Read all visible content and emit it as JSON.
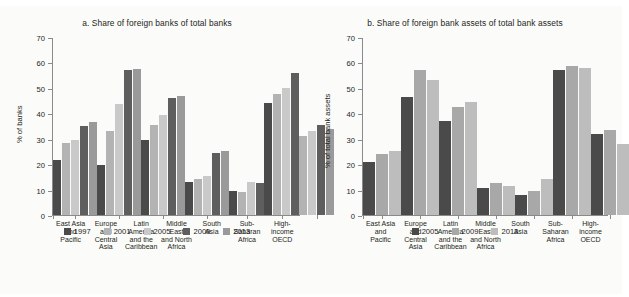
{
  "figure": {
    "background": "#fbfbf9",
    "regions": [
      [
        "East Asia",
        "and",
        "Pacific"
      ],
      [
        "Europe",
        "and",
        "Central",
        "Asia"
      ],
      [
        "Latin",
        "America",
        "and the",
        "Caribbean"
      ],
      [
        "Middle",
        "East",
        "and North",
        "Africa"
      ],
      [
        "South",
        "Asia"
      ],
      [
        "Sub-",
        "Saharan",
        "Africa"
      ],
      [
        "High-",
        "income",
        "OECD"
      ]
    ]
  },
  "chart_data": [
    {
      "type": "bar",
      "panel": "a",
      "title": "a. Share of foreign banks of total banks",
      "xlabel": "",
      "ylabel": "% of banks",
      "ylim": [
        0,
        70
      ],
      "yticks": [
        0,
        10,
        20,
        30,
        40,
        50,
        60,
        70
      ],
      "ytick_labels": [
        "0",
        "10",
        "20",
        "30",
        "40",
        "50",
        "60",
        "70"
      ],
      "grid": false,
      "legend_position": "bottom",
      "categories": [
        "East Asia and Pacific",
        "Europe and Central Asia",
        "Latin America and the Caribbean",
        "Middle East and North Africa",
        "South Asia",
        "Sub-Saharan Africa",
        "High-income OECD"
      ],
      "series": [
        {
          "name": "1997",
          "color": "#4a4a4a",
          "values": [
            21.5,
            19.5,
            29.5,
            13.0,
            9.5,
            44.0,
            null
          ]
        },
        {
          "name": "2001",
          "color": "#b3b3b3",
          "values": [
            28.5,
            33.0,
            35.5,
            14.0,
            9.0,
            47.5,
            31.0
          ]
        },
        {
          "name": "2005",
          "color": "#c9c9c9",
          "values": [
            29.5,
            43.5,
            39.5,
            15.5,
            13.0,
            50.0,
            33.0
          ]
        },
        {
          "name": "2009",
          "color": "#5e5e5e",
          "values": [
            35.0,
            57.0,
            46.0,
            24.5,
            12.5,
            56.0,
            35.5
          ]
        },
        {
          "name": "2013",
          "color": "#9a9a9a",
          "values": [
            36.5,
            57.5,
            47.0,
            25.0,
            null,
            null,
            34.0
          ]
        }
      ]
    },
    {
      "type": "bar",
      "panel": "b",
      "title": "b. Share of foreign bank assets of total bank assets",
      "xlabel": "",
      "ylabel": "% of total bank assets",
      "ylim": [
        0,
        70
      ],
      "yticks": [
        0,
        10,
        20,
        30,
        40,
        50,
        60,
        70
      ],
      "ytick_labels": [
        "0",
        "10",
        "20",
        "30",
        "40",
        "50",
        "60",
        "70"
      ],
      "grid": false,
      "legend_position": "bottom",
      "categories": [
        "East Asia and Pacific",
        "Europe and Central Asia",
        "Latin America and the Caribbean",
        "Middle East and North Africa",
        "South Asia",
        "Sub-Saharan Africa",
        "High-income OECD"
      ],
      "series": [
        {
          "name": "2005",
          "color": "#4a4a4a",
          "values": [
            21.0,
            46.5,
            37.0,
            10.5,
            8.0,
            57.0,
            32.0
          ]
        },
        {
          "name": "2009",
          "color": "#a8a8a8",
          "values": [
            24.0,
            57.0,
            42.5,
            12.5,
            9.5,
            58.5,
            33.5
          ]
        },
        {
          "name": "2013",
          "color": "#bdbdbd",
          "values": [
            25.0,
            53.0,
            44.5,
            11.5,
            14.0,
            58.0,
            28.0
          ]
        }
      ]
    }
  ]
}
